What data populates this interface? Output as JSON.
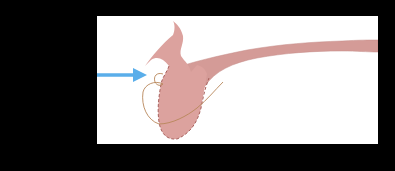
{
  "figure": {
    "type": "anatomical-illustration",
    "background": "#000000",
    "panel_background": "#ffffff",
    "elements": [
      {
        "name": "inflow-arrow",
        "color": "#5aaeea",
        "direction": "right"
      },
      {
        "name": "pink-organ",
        "fill": "#dca29e",
        "outline": "#b0706c",
        "outline_style": "dashed-lower"
      },
      {
        "name": "tube-extension",
        "fill": "#d39a96",
        "direction": "right"
      },
      {
        "name": "thin-outline-loop",
        "stroke": "#b8875a"
      }
    ],
    "labels": []
  }
}
